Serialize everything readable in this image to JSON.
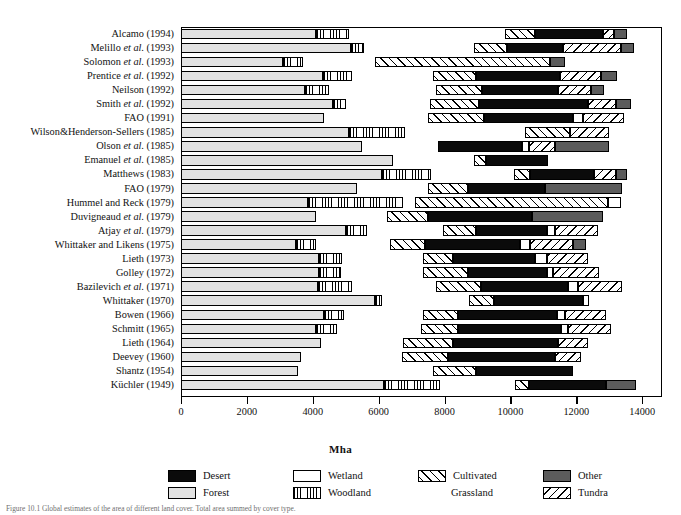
{
  "chart_data": {
    "type": "bar",
    "orientation": "horizontal",
    "stacked": true,
    "title": "",
    "xlabel": "Mha",
    "ylabel": "",
    "xlim": [
      0,
      14600
    ],
    "xticks": [
      0,
      2000,
      4000,
      6000,
      8000,
      10000,
      12000,
      14000
    ],
    "xticklabels": [
      "0",
      "2000",
      "4000",
      "6000",
      "8000",
      "10000",
      "12000",
      "14000"
    ],
    "grid": false,
    "legend_position": "bottom",
    "categories": [
      "Alcamo (1994)",
      "Melillo et al. (1993)",
      "Solomon et al. (1993)",
      "Prentice et al. (1992)",
      "Neilson (1992)",
      "Smith et al. (1992)",
      "FAO (1991)",
      "Wilson&Henderson-Sellers (1985)",
      "Olson et al. (1985)",
      "Emanuel et al. (1985)",
      "Matthews (1983)",
      "FAO (1979)",
      "Hummel and Reck (1979)",
      "Duvigneaud et al. (1979)",
      "Atjay et al. (1979)",
      "Whittaker and Likens (1975)",
      "Lieth (1973)",
      "Golley (1972)",
      "Bazilevich et al. (1971)",
      "Whittaker (1970)",
      "Bowen (1966)",
      "Schmitt (1965)",
      "Lieth (1964)",
      "Deevey (1960)",
      "Shantz (1954)",
      "Küchler (1949)"
    ],
    "series": [
      {
        "name": "Forest",
        "key": "forest",
        "values": [
          4100,
          5150,
          3100,
          4300,
          3750,
          4600,
          4350,
          5100,
          5500,
          6450,
          6100,
          5350,
          3850,
          4100,
          5000,
          3500,
          4200,
          4200,
          4150,
          5900,
          4350,
          4100,
          4250,
          3650,
          3550,
          6150
        ]
      },
      {
        "name": "Woodland",
        "key": "woodland",
        "values": [
          1000,
          400,
          600,
          900,
          750,
          400,
          0,
          1700,
          0,
          0,
          1500,
          0,
          2900,
          0,
          650,
          600,
          700,
          650,
          1050,
          200,
          600,
          650,
          0,
          0,
          0,
          1700
        ]
      },
      {
        "name": "Grassland",
        "key": "grassland",
        "values": [
          4750,
          3350,
          2200,
          2450,
          3250,
          2550,
          3150,
          3650,
          2300,
          2450,
          2500,
          2150,
          350,
          2150,
          2300,
          2250,
          2450,
          2500,
          2550,
          2650,
          2400,
          2550,
          2500,
          3050,
          4100,
          2300
        ]
      },
      {
        "name": "Cultivated",
        "key": "cultivated",
        "values": [
          900,
          1000,
          5300,
          1300,
          1400,
          1500,
          1700,
          1350,
          0,
          350,
          500,
          1200,
          5850,
          1250,
          1000,
          1050,
          900,
          1350,
          1350,
          750,
          1050,
          1100,
          1500,
          1400,
          1300,
          400
        ]
      },
      {
        "name": "Desert",
        "key": "desert",
        "values": [
          2050,
          1700,
          0,
          2550,
          2300,
          3300,
          2700,
          0,
          2550,
          1900,
          1950,
          2350,
          0,
          3150,
          2150,
          2900,
          2500,
          2400,
          2650,
          2700,
          3000,
          3150,
          3200,
          3250,
          2950,
          2350
        ]
      },
      {
        "name": "Wetland",
        "key": "wetland",
        "values": [
          0,
          0,
          0,
          0,
          0,
          0,
          300,
          0,
          200,
          0,
          0,
          0,
          400,
          0,
          250,
          300,
          350,
          200,
          300,
          200,
          250,
          200,
          0,
          0,
          0,
          0
        ]
      },
      {
        "name": "Tundra",
        "key": "tundra",
        "values": [
          350,
          1750,
          0,
          1250,
          1000,
          850,
          1250,
          1200,
          800,
          0,
          650,
          0,
          0,
          0,
          1300,
          1300,
          1250,
          1400,
          1350,
          0,
          1250,
          1300,
          900,
          800,
          0,
          0
        ]
      },
      {
        "name": "Other",
        "key": "other",
        "values": [
          400,
          400,
          450,
          500,
          400,
          450,
          0,
          0,
          1650,
          0,
          350,
          2350,
          0,
          2150,
          0,
          400,
          0,
          0,
          0,
          0,
          0,
          0,
          0,
          0,
          0,
          900
        ]
      }
    ]
  },
  "legend": {
    "items": [
      {
        "label": "Desert",
        "key": "desert"
      },
      {
        "label": "Wetland",
        "key": "wetland"
      },
      {
        "label": "Cultivated",
        "key": "cultivated"
      },
      {
        "label": "Other",
        "key": "other"
      },
      {
        "label": "Forest",
        "key": "forest"
      },
      {
        "label": "Woodland",
        "key": "woodland"
      },
      {
        "label": "Grassland",
        "key": "grassland"
      },
      {
        "label": "Tundra",
        "key": "tundra"
      }
    ]
  },
  "colors": {
    "desert": "#0b0b0b",
    "grassland": "#070707",
    "forest": "#e2e2e2",
    "wetland": "#ffffff",
    "other": "#5c5c5c",
    "outline": "#000000",
    "caption_text": "#6f6f6f"
  },
  "caption": {
    "text": "Figure 10.1 Global estimates of the area of different land cover. Total area summed by cover type."
  }
}
